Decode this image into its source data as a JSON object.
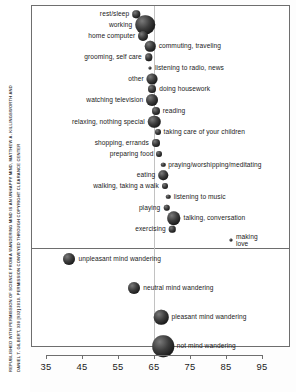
{
  "figure": {
    "credit_line_1": "REPUBLISHED WITH PERMISSION OF SCIENCE FROM A WANDERING MIND IS AN UNHAPPY MIND, MATTHEW A. KILLINGSWORTH AND",
    "credit_line_2": "DANIEL T. GILBERT, 330 [932] 2010. PERMISSION CONVEYED THROUGH COPYRIGHT CLEARANCE CENTER",
    "frame_color": "#6e6e6e",
    "bubble_color": "#1a1a1a",
    "reference_line_color": "#c2c2c2"
  },
  "chart_data": {
    "type": "scatter",
    "title": "",
    "xlabel": "",
    "ylabel": "",
    "xlim": [
      32,
      97
    ],
    "ylim": [
      0,
      1
    ],
    "grid": false,
    "legend": "none",
    "reference_line_x": 65,
    "xticks": [
      35,
      45,
      55,
      65,
      75,
      85,
      95
    ],
    "panels": [
      {
        "name": "activities",
        "points": [
          {
            "label": "rest/sleep",
            "x": 60.0,
            "size": 7.5,
            "label_side": "left"
          },
          {
            "label": "working",
            "x": 62.5,
            "size": 19.5,
            "label_side": "left"
          },
          {
            "label": "home computer",
            "x": 62.0,
            "size": 10.0,
            "label_side": "left"
          },
          {
            "label": "commuting, traveling",
            "x": 64.0,
            "size": 10.5,
            "label_side": "right"
          },
          {
            "label": "grooming, self care",
            "x": 63.5,
            "size": 7.5,
            "label_side": "left"
          },
          {
            "label": "listening to radio, news",
            "x": 64.0,
            "size": 3.0,
            "label_side": "right"
          },
          {
            "label": "other",
            "x": 64.5,
            "size": 11.0,
            "label_side": "left"
          },
          {
            "label": "doing housework",
            "x": 64.5,
            "size": 8.0,
            "label_side": "right"
          },
          {
            "label": "watching television",
            "x": 64.5,
            "size": 12.0,
            "label_side": "left"
          },
          {
            "label": "reading",
            "x": 65.5,
            "size": 8.0,
            "label_side": "right"
          },
          {
            "label": "relaxing, nothing special",
            "x": 65.0,
            "size": 12.5,
            "label_side": "left"
          },
          {
            "label": "taking care of your children",
            "x": 66.0,
            "size": 6.0,
            "label_side": "right"
          },
          {
            "label": "shopping, errands",
            "x": 65.5,
            "size": 8.0,
            "label_side": "left"
          },
          {
            "label": "preparing food",
            "x": 66.5,
            "size": 6.0,
            "label_side": "left"
          },
          {
            "label": "praying/worshipping/meditating",
            "x": 67.5,
            "size": 4.5,
            "label_side": "right"
          },
          {
            "label": "eating",
            "x": 67.5,
            "size": 9.5,
            "label_side": "left"
          },
          {
            "label": "walking, taking a walk",
            "x": 68.0,
            "size": 6.0,
            "label_side": "left"
          },
          {
            "label": "listening to music",
            "x": 69.0,
            "size": 4.5,
            "label_side": "right"
          },
          {
            "label": "playing",
            "x": 68.5,
            "size": 6.5,
            "label_side": "left"
          },
          {
            "label": "talking, conversation",
            "x": 70.5,
            "size": 13.5,
            "label_side": "right"
          },
          {
            "label": "exercising",
            "x": 70.0,
            "size": 6.5,
            "label_side": "left"
          },
          {
            "label": "making love",
            "x": 86.5,
            "size": 3.0,
            "label_side": "right"
          }
        ]
      },
      {
        "name": "mind-wandering",
        "points": [
          {
            "label": "unpleasant mind wandering",
            "x": 41.5,
            "size": 12.0,
            "label_side": "right"
          },
          {
            "label": "neutral mind wandering",
            "x": 59.5,
            "size": 12.0,
            "label_side": "right"
          },
          {
            "label": "pleasant mind wandering",
            "x": 67.0,
            "size": 14.5,
            "label_side": "right"
          },
          {
            "label": "not mind wandering",
            "x": 67.5,
            "size": 21.5,
            "label_side": "right"
          }
        ]
      }
    ]
  }
}
